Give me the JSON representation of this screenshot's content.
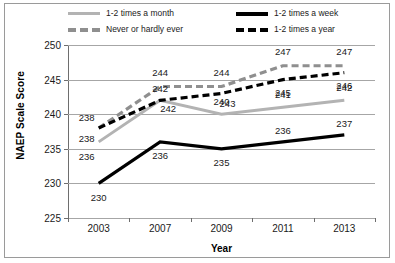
{
  "chart_data": {
    "type": "line",
    "title": "",
    "xlabel": "Year",
    "ylabel": "NAEP Scale Score",
    "categories": [
      "2003",
      "2007",
      "2009",
      "2011",
      "2013"
    ],
    "ylim": [
      225,
      250
    ],
    "yticks": [
      225,
      230,
      235,
      240,
      245,
      250
    ],
    "grid": true,
    "legend_position": "top",
    "series": [
      {
        "name": "1-2 times a month",
        "color": "#b3b3b3",
        "style": "solid",
        "values": [
          236,
          242,
          240,
          241,
          242
        ]
      },
      {
        "name": "1-2 times a week",
        "color": "#000000",
        "style": "solid",
        "values": [
          230,
          236,
          235,
          236,
          237
        ]
      },
      {
        "name": "Never or hardly ever",
        "color": "#8f8f8f",
        "style": "dashed",
        "values": [
          238,
          244,
          244,
          247,
          247
        ]
      },
      {
        "name": "1-2 times a year",
        "color": "#000000",
        "style": "dashed",
        "values": [
          238,
          242,
          243,
          245,
          246
        ]
      }
    ]
  },
  "legend": {
    "items": [
      {
        "label": "1-2 times a month"
      },
      {
        "label": "Never or hardly ever"
      },
      {
        "label": "1-2 times a week"
      },
      {
        "label": "1-2 times a year"
      }
    ]
  },
  "axes": {
    "y_title": "NAEP Scale Score",
    "x_title": "Year",
    "y_ticks": [
      "250",
      "245",
      "240",
      "235",
      "230",
      "225"
    ],
    "x_ticks": [
      "2003",
      "2007",
      "2009",
      "2011",
      "2013"
    ]
  },
  "point_labels": {
    "month": [
      "236",
      "242",
      "240",
      "241",
      "242"
    ],
    "week": [
      "230",
      "236",
      "235",
      "236",
      "237"
    ],
    "never": [
      "238",
      "244",
      "244",
      "247",
      "247"
    ],
    "year": [
      "238",
      "242",
      "243",
      "245",
      "246"
    ]
  }
}
